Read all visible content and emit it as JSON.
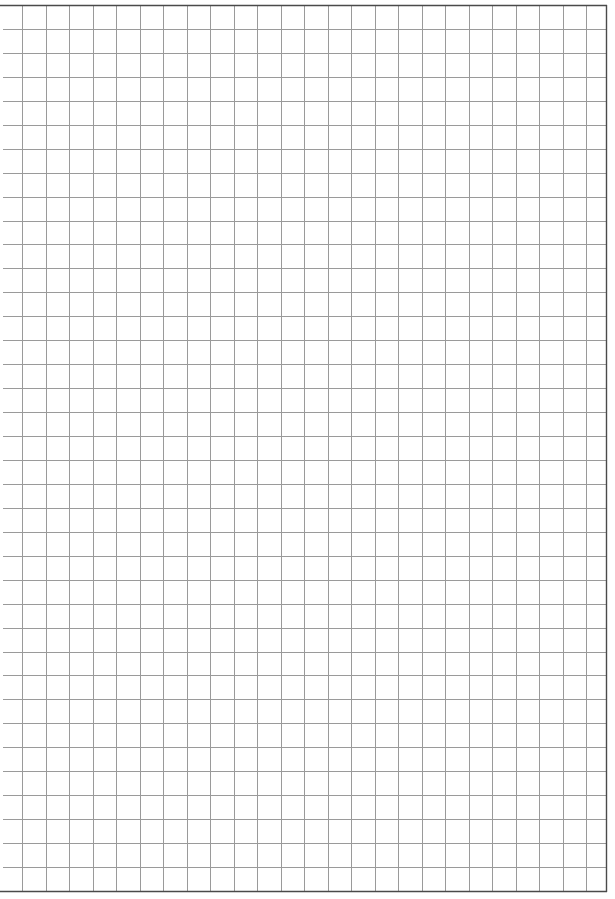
{
  "page": {
    "type": "graph-paper",
    "background_color": "#ffffff"
  },
  "grid": {
    "top": 5,
    "bottom": 891,
    "left": 3,
    "right": 606,
    "first_vertical_x": 22,
    "cell_width": 23.5,
    "cell_height": 23.95,
    "rows": 37,
    "columns": 25,
    "line_color": "#9a9a9a",
    "border_color": "#4a4a4a",
    "line_width": 1,
    "border_width": 1.4
  }
}
